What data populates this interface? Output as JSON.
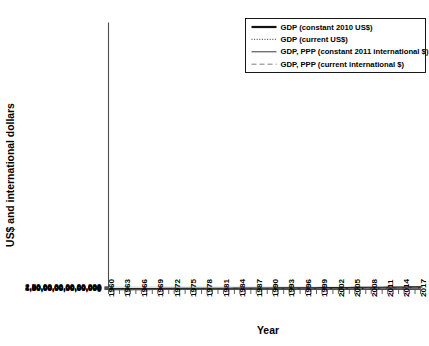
{
  "chart_data": {
    "type": "line",
    "title": "",
    "xlabel": "Year",
    "ylabel": "US$ and international dollars",
    "xlim": [
      1960,
      2017
    ],
    "ylim": [
      0,
      25000000000000000
    ],
    "grid": true,
    "legend_position": "top-right",
    "ytick_labels": [
      "0",
      "50,00,00,00,00,000",
      "1,00,00,00,00,00,000",
      "1,50,00,00,00,00,000",
      "2,00,00,00,00,00,000",
      "2,50,00,00,00,00,000"
    ],
    "ytick_values": [
      0,
      50000000000000,
      100000000000000,
      150000000000000,
      200000000000000,
      250000000000000
    ],
    "xtick_labels": [
      "1960",
      "1963",
      "1966",
      "1969",
      "1972",
      "1975",
      "1978",
      "1981",
      "1984",
      "1987",
      "1990",
      "1993",
      "1996",
      "1999",
      "2002",
      "2005",
      "2008",
      "2011",
      "2014",
      "2017"
    ],
    "x": [
      1960,
      1961,
      1962,
      1963,
      1964,
      1965,
      1966,
      1967,
      1968,
      1969,
      1970,
      1971,
      1972,
      1973,
      1974,
      1975,
      1976,
      1977,
      1978,
      1979,
      1980,
      1981,
      1982,
      1983,
      1984,
      1985,
      1986,
      1987,
      1988,
      1989,
      1990,
      1991,
      1992,
      1993,
      1994,
      1995,
      1996,
      1997,
      1998,
      1999,
      2000,
      2001,
      2002,
      2003,
      2004,
      2005,
      2006,
      2007,
      2008,
      2009,
      2010,
      2011,
      2012,
      2013,
      2014,
      2015,
      2016,
      2017
    ],
    "series": [
      {
        "name": "GDP (constant 2010 US$)",
        "style": "solid-thick",
        "color": "#111111",
        "values": [
          30.2,
          31.6,
          33.3,
          34.9,
          37.1,
          39.2,
          41.4,
          42.9,
          45.2,
          47.6,
          49.3,
          51.2,
          53.7,
          56.9,
          58.2,
          58.9,
          61.6,
          64.1,
          67.0,
          69.5,
          70.8,
          71.9,
          72.3,
          74.1,
          77.3,
          80.1,
          82.8,
          86.0,
          90.0,
          93.3,
          95.9,
          96.9,
          98.5,
          100.4,
          103.6,
          106.6,
          110.3,
          114.6,
          117.5,
          121.5,
          126.5,
          128.7,
          131.5,
          135.6,
          141.5,
          147.0,
          153.3,
          159.6,
          161.6,
          159.0,
          165.8,
          170.8,
          175.3,
          180.3,
          185.5,
          190.7,
          195.8,
          201.9
        ]
      },
      {
        "name": "GDP (current US$)",
        "style": "dotted",
        "color": "#555555",
        "values": [
          1.4,
          1.5,
          1.6,
          1.8,
          1.9,
          2.1,
          2.3,
          2.4,
          2.6,
          2.9,
          3.2,
          3.5,
          3.9,
          4.7,
          5.4,
          5.9,
          6.4,
          7.2,
          8.6,
          9.9,
          11.2,
          11.7,
          11.6,
          11.9,
          12.5,
          13.2,
          15.3,
          17.1,
          19.0,
          20.1,
          22.5,
          23.6,
          25.3,
          25.8,
          27.7,
          30.8,
          31.6,
          31.4,
          31.7,
          32.9,
          33.8,
          33.2,
          34.6,
          39.0,
          44.1,
          47.6,
          51.4,
          58.0,
          63.7,
          60.4,
          66.2,
          73.4,
          75.2,
          77.2,
          79.5,
          74.8,
          76.1,
          80.9
        ]
      },
      {
        "name": "GDP, PPP (constant 2011 international $)",
        "style": "solid-thin",
        "color": "#3a3a3a",
        "values": [
          30.7,
          32.1,
          33.8,
          35.5,
          37.7,
          39.8,
          42.0,
          43.5,
          45.9,
          48.3,
          50.0,
          52.0,
          54.6,
          57.8,
          59.1,
          59.8,
          62.5,
          65.1,
          68.1,
          70.6,
          71.9,
          73.1,
          73.5,
          75.3,
          78.6,
          81.4,
          84.2,
          87.4,
          91.5,
          94.9,
          97.5,
          98.6,
          100.2,
          102.2,
          105.5,
          108.6,
          112.4,
          116.8,
          119.7,
          123.8,
          128.9,
          131.2,
          134.0,
          138.2,
          144.2,
          149.8,
          156.3,
          162.7,
          164.8,
          162.0,
          169.0,
          174.1,
          178.7,
          183.8,
          189.1,
          194.4,
          199.7,
          205.9
        ]
      },
      {
        "name": "GDP, PPP (current international $)",
        "style": "dashed",
        "color": "#777777",
        "values": [
          2.0,
          2.2,
          2.4,
          2.6,
          2.9,
          3.1,
          3.4,
          3.6,
          3.9,
          4.3,
          4.7,
          5.2,
          5.8,
          6.6,
          7.4,
          8.1,
          8.9,
          9.9,
          11.1,
          12.6,
          14.1,
          15.3,
          16.0,
          17.1,
          18.9,
          20.4,
          22.0,
          24.0,
          26.6,
          29.0,
          31.3,
          33.2,
          35.4,
          37.4,
          40.4,
          43.6,
          46.6,
          49.6,
          51.7,
          54.6,
          58.8,
          61.4,
          64.3,
          68.6,
          75.1,
          81.3,
          88.5,
          96.3,
          102.6,
          101.9,
          109.7,
          118.4,
          124.3,
          130.2,
          137.2,
          142.1,
          147.6,
          157.0
        ]
      }
    ]
  }
}
